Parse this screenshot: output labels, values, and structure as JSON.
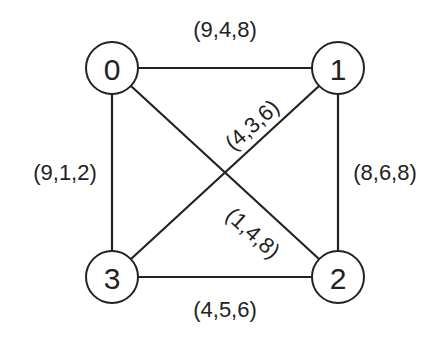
{
  "graph": {
    "nodes": [
      {
        "id": "0",
        "label": "0",
        "x": 112,
        "y": 68
      },
      {
        "id": "1",
        "label": "1",
        "x": 338,
        "y": 68
      },
      {
        "id": "2",
        "label": "2",
        "x": 338,
        "y": 277
      },
      {
        "id": "3",
        "label": "3",
        "x": 112,
        "y": 277
      }
    ],
    "edges": [
      {
        "from": "0",
        "to": "1",
        "label": "(9,4,8)"
      },
      {
        "from": "0",
        "to": "3",
        "label": "(9,1,2)"
      },
      {
        "from": "1",
        "to": "2",
        "label": "(8,6,8)"
      },
      {
        "from": "3",
        "to": "2",
        "label": "(4,5,6)"
      },
      {
        "from": "1",
        "to": "3",
        "label": "(4,3,6)"
      },
      {
        "from": "0",
        "to": "2",
        "label": "(1,4,8)"
      }
    ]
  }
}
